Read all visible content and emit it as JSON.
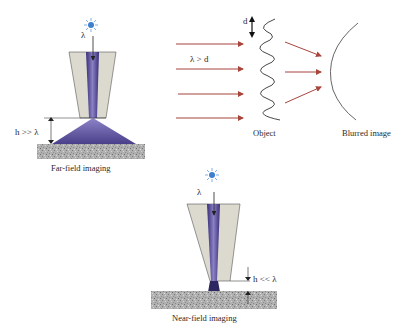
{
  "far_field": {
    "caption": "Far-field imaging",
    "wavelength_label": "λ",
    "distance_label": "h >> λ"
  },
  "diffraction": {
    "condition_label": "λ > d",
    "period_label": "d",
    "object_label": "Object",
    "image_label": "Blurred image"
  },
  "near_field": {
    "caption": "Near-field imaging",
    "wavelength_label": "λ",
    "distance_label": "h << λ"
  },
  "colors": {
    "light_beam": "#6a5fa8",
    "light_beam_dark": "#2e2660",
    "fiber_cladding": "#d9d6cc",
    "substrate": "#a8a8a8",
    "ray_arrow": "#a8453c",
    "light_source": "#4a8fd6",
    "line": "#222222"
  }
}
